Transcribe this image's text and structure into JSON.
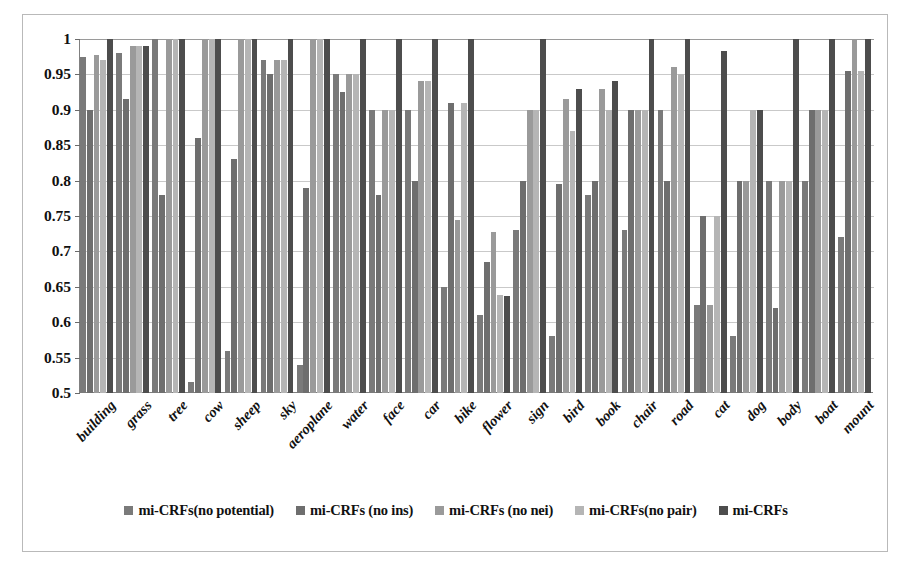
{
  "chart_data": {
    "type": "bar",
    "title": "",
    "subtitle": "",
    "xlabel": "",
    "ylabel": "",
    "ylim": [
      0.5,
      1.0
    ],
    "yticks": [
      "0.5",
      "0.55",
      "0.6",
      "0.65",
      "0.7",
      "0.75",
      "0.8",
      "0.85",
      "0.9",
      "0.95",
      "1"
    ],
    "ytick_values": [
      0.5,
      0.55,
      0.6,
      0.65,
      0.7,
      0.75,
      0.8,
      0.85,
      0.9,
      0.95,
      1.0
    ],
    "grid": true,
    "legend_position": "bottom",
    "categories": [
      "building",
      "grass",
      "tree",
      "cow",
      "sheep",
      "sky",
      "aeroplane",
      "water",
      "face",
      "car",
      "bike",
      "flower",
      "sign",
      "bird",
      "book",
      "chair",
      "road",
      "cat",
      "dog",
      "body",
      "boat",
      "mount"
    ],
    "series": [
      {
        "name": "mi-CRFs(no potential)",
        "color": "#7a7a7a",
        "values": [
          0.975,
          0.98,
          1.0,
          0.515,
          0.56,
          0.97,
          0.54,
          0.95,
          0.9,
          0.9,
          0.65,
          0.61,
          0.73,
          0.58,
          0.78,
          0.73,
          0.9,
          0.625,
          0.58,
          0.8,
          0.8,
          0.72
        ]
      },
      {
        "name": "mi-CRFs (no ins)",
        "color": "#6e6e6e",
        "values": [
          0.9,
          0.915,
          0.78,
          0.86,
          0.83,
          0.95,
          0.79,
          0.925,
          0.78,
          0.8,
          0.91,
          0.685,
          0.8,
          0.795,
          0.8,
          0.9,
          0.8,
          0.75,
          0.8,
          0.62,
          0.9,
          0.955
        ]
      },
      {
        "name": "mi-CRFs (no nei)",
        "color": "#9a9a9a",
        "values": [
          0.978,
          0.99,
          1.0,
          1.0,
          1.0,
          0.97,
          1.0,
          0.95,
          0.9,
          0.94,
          0.745,
          0.728,
          0.9,
          0.915,
          0.93,
          0.9,
          0.96,
          0.625,
          0.8,
          0.8,
          0.9,
          1.0
        ]
      },
      {
        "name": "mi-CRFs(no pair)",
        "color": "#b5b5b5",
        "values": [
          0.97,
          0.99,
          1.0,
          1.0,
          1.0,
          0.97,
          1.0,
          0.95,
          0.9,
          0.94,
          0.91,
          0.638,
          0.9,
          0.87,
          0.9,
          0.9,
          0.95,
          0.75,
          0.9,
          0.8,
          0.9,
          0.955
        ]
      },
      {
        "name": "mi-CRFs",
        "color": "#4d4d4d",
        "values": [
          1.0,
          0.99,
          1.0,
          1.0,
          1.0,
          1.0,
          1.0,
          1.0,
          1.0,
          1.0,
          1.0,
          0.637,
          1.0,
          0.93,
          0.94,
          1.0,
          1.0,
          0.983,
          0.9,
          1.0,
          1.0,
          1.0
        ]
      }
    ]
  },
  "legend": {
    "items": [
      {
        "label": "mi-CRFs(no potential)",
        "color": "#7a7a7a"
      },
      {
        "label": "mi-CRFs (no ins)",
        "color": "#6e6e6e"
      },
      {
        "label": "mi-CRFs (no nei)",
        "color": "#9a9a9a"
      },
      {
        "label": "mi-CRFs(no pair)",
        "color": "#b5b5b5"
      },
      {
        "label": "mi-CRFs",
        "color": "#4d4d4d"
      }
    ]
  },
  "axis": {
    "y_max_label": "1",
    "y_min_label": "0.5"
  }
}
